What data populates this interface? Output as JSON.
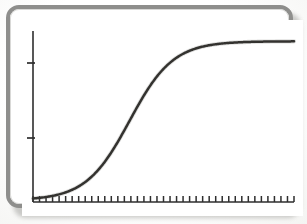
{
  "figure": {
    "kind": "scanned-plot-figure",
    "frame_color": "#8e8e8c",
    "panel_color": "#ffffff",
    "shadow_color": "#b9b9b6",
    "ink_color": "#33322f",
    "caption": ""
  },
  "chart_data": {
    "type": "line",
    "title": "",
    "subtitle": "",
    "xlabel": "",
    "ylabel": "",
    "grid": false,
    "legend": null,
    "annotations": [],
    "xlim": [
      0,
      40
    ],
    "ylim": [
      0,
      1
    ],
    "x_tick_labels": [],
    "y_tick_labels": [],
    "x_tick_count": 40,
    "y_tick_values": [
      0.36,
      0.82
    ],
    "curve_shape": "sigmoid",
    "curve_description": "Monotonic S-shaped logistic growth curve rising from a flat near-zero baseline to a flat upper plateau",
    "inflection_x": 14.8,
    "inflection_y": 0.5,
    "steepness": 0.3,
    "plateau_value": 0.98,
    "baseline_value": 0.01,
    "series": [
      {
        "name": "logistic",
        "x": [
          0,
          1,
          2,
          3,
          4,
          5,
          6,
          7,
          8,
          9,
          10,
          11,
          12,
          13,
          14,
          15,
          16,
          17,
          18,
          19,
          20,
          21,
          22,
          23,
          24,
          25,
          26,
          27,
          28,
          29,
          30,
          31,
          32,
          33,
          34,
          35,
          36,
          37,
          38,
          39,
          40
        ],
        "y": [
          0.012,
          0.016,
          0.021,
          0.028,
          0.038,
          0.05,
          0.066,
          0.087,
          0.113,
          0.146,
          0.187,
          0.236,
          0.294,
          0.359,
          0.43,
          0.504,
          0.577,
          0.646,
          0.709,
          0.763,
          0.808,
          0.845,
          0.875,
          0.899,
          0.918,
          0.933,
          0.944,
          0.953,
          0.96,
          0.966,
          0.97,
          0.974,
          0.977,
          0.979,
          0.981,
          0.983,
          0.984,
          0.985,
          0.986,
          0.987,
          0.988
        ]
      }
    ]
  },
  "axes": {
    "y_axis_name": "vertical-axis",
    "x_axis_name": "horizontal-axis"
  }
}
